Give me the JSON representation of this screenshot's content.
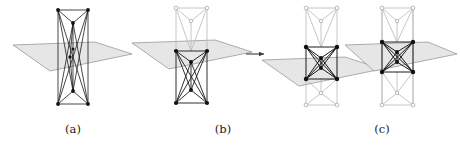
{
  "figure": {
    "background_color": "#ffffff",
    "width": 460,
    "height": 145
  },
  "captions": [
    {
      "id": "a",
      "label": "(a)"
    },
    {
      "id": "b",
      "label": "(b)"
    },
    {
      "id": "c",
      "label": "(c)"
    }
  ],
  "colors": {
    "slab_fill": "#e6e6e6",
    "slab_stroke": "#8c8c8c",
    "edge_dark": "#1a1a1a",
    "edge_light": "#b0b0b0",
    "vertex_dark": "#111111",
    "vertex_light_fill": "#ffffff",
    "vertex_light_stroke": "#b0b0b0",
    "arrow": "#3a3a3a",
    "caption_text": "#1a1a1a"
  },
  "panels": [
    {
      "id": "panel-a",
      "caption": "(a)",
      "subfigure_count": 1,
      "has_arrow": false,
      "slab_count": 1,
      "note": "Single tall prism-like graph with all vertices dark; one horizontal shaded slab crosses the middle"
    },
    {
      "id": "panel-b",
      "caption": "(b)",
      "subfigure_count": 2,
      "has_arrow": true,
      "arrow_glyph": "→",
      "slab_count": 2,
      "note": "Left: upper half light, lower half dark, slab at upper-middle. Right: slab moved down, dark cluster centered"
    },
    {
      "id": "panel-c",
      "caption": "(c)",
      "subfigure_count": 1,
      "has_arrow": false,
      "slab_count": 1,
      "note": "Outer vertices light, central octahedral block dark with crossing X edges inside the slab"
    }
  ]
}
